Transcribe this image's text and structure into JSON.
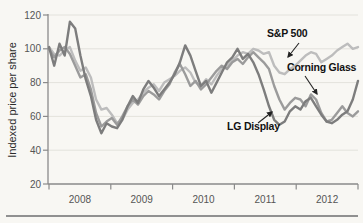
{
  "page": {
    "background": "#f8f7f3",
    "bottom_rule_color": "#909090"
  },
  "chart_data": {
    "type": "line",
    "title": "",
    "ylabel": "Indexed price per share",
    "xlabel": "",
    "ylim": [
      20,
      120
    ],
    "yticks": [
      20,
      40,
      60,
      80,
      100,
      120
    ],
    "xticklabels": [
      "2008",
      "2009",
      "2010",
      "2011",
      "2012"
    ],
    "x_range": [
      "2008-01",
      "2012-12"
    ],
    "x_interval": "monthly",
    "grid": true,
    "legend_position": "inline-annotations",
    "axis_color": "#8a8a8a",
    "grid_color": "#e3e2dc",
    "series": [
      {
        "name": "S&P 500",
        "color": "#bdbdbd",
        "values": [
          101,
          97,
          96,
          99,
          101,
          93,
          87,
          89,
          83,
          70,
          64,
          65,
          61,
          56,
          58,
          64,
          68,
          70,
          74,
          77,
          79,
          75,
          80,
          82,
          84,
          87,
          89,
          86,
          80,
          78,
          82,
          79,
          84,
          88,
          90,
          93,
          96,
          98,
          97,
          100,
          99,
          97,
          98,
          90,
          86,
          85,
          88,
          90,
          93,
          96,
          98,
          97,
          92,
          94,
          96,
          99,
          101,
          103,
          100,
          101
        ]
      },
      {
        "name": "Corning Glass",
        "color": "#9b9b9b",
        "values": [
          100,
          95,
          99,
          101,
          97,
          90,
          83,
          85,
          76,
          62,
          54,
          57,
          59,
          55,
          60,
          66,
          70,
          67,
          72,
          75,
          73,
          70,
          75,
          79,
          86,
          91,
          85,
          78,
          81,
          76,
          79,
          83,
          87,
          90,
          88,
          92,
          94,
          91,
          95,
          98,
          95,
          92,
          88,
          78,
          70,
          64,
          68,
          71,
          70,
          66,
          73,
          70,
          62,
          57,
          58,
          62,
          66,
          62,
          60,
          63
        ]
      },
      {
        "name": "LG Display",
        "color": "#7d7d7d",
        "values": [
          101,
          90,
          103,
          96,
          116,
          112,
          96,
          82,
          72,
          58,
          50,
          56,
          54,
          53,
          58,
          66,
          72,
          68,
          76,
          81,
          77,
          72,
          76,
          80,
          85,
          92,
          102,
          96,
          87,
          78,
          81,
          74,
          80,
          86,
          92,
          95,
          100,
          94,
          97,
          92,
          85,
          76,
          66,
          58,
          55,
          57,
          63,
          66,
          64,
          69,
          71,
          66,
          61,
          57,
          56,
          58,
          61,
          63,
          70,
          81
        ]
      }
    ],
    "annotations": [
      {
        "label": "S&P 500",
        "arrow_from": [
          299,
          43
        ],
        "arrow_to": [
          288,
          57
        ]
      },
      {
        "label": "Corning Glass",
        "arrow_from": [
          305,
          76
        ],
        "arrow_to": [
          317,
          94
        ]
      },
      {
        "label": "LG Display",
        "arrow_from": [
          258,
          123
        ],
        "arrow_to": [
          272,
          112
        ]
      }
    ]
  }
}
